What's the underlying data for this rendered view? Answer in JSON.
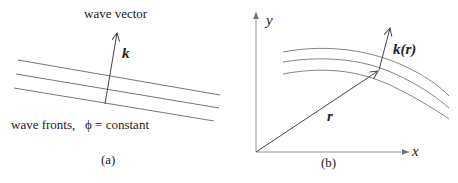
{
  "panel_a": {
    "title": "wave vector",
    "vector_label": "k",
    "wavefront_label": "wave fronts,   ϕ = constant",
    "panel_label": "(a)"
  },
  "panel_b": {
    "y_axis_label": "y",
    "x_axis_label": "x",
    "position_vector_label": "r",
    "wave_vector_label": "k(r)",
    "panel_label": "(b)"
  },
  "colors": {
    "line": "#555555",
    "text": "#222222"
  }
}
